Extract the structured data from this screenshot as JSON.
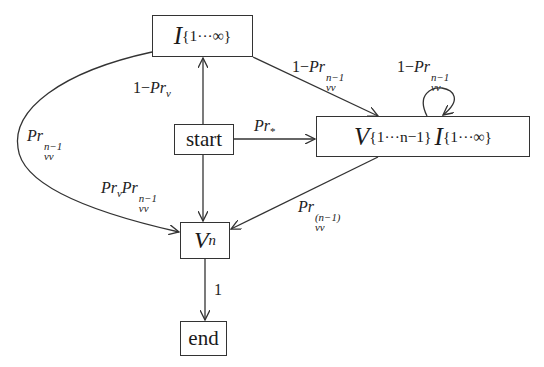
{
  "diagram": {
    "type": "state-transition-graph",
    "nodes": {
      "I": {
        "base": "I",
        "sup": "{1···∞}"
      },
      "start": {
        "label": "start"
      },
      "V": {
        "base1": "V",
        "sup1": "{1···n−1}",
        "base2": "I",
        "sup2": "{1···∞}"
      },
      "Vn": {
        "base": "V",
        "sup": "n"
      },
      "end": {
        "label": "end"
      }
    },
    "edges": [
      {
        "from": "start",
        "to": "I",
        "label": {
          "pre": "1−",
          "base": "Pr",
          "sub": "v"
        }
      },
      {
        "from": "I",
        "to": "V",
        "label": {
          "pre": "1−",
          "base": "Pr",
          "sup": "n−1",
          "sub": "vv"
        }
      },
      {
        "from": "V",
        "to": "V",
        "label": {
          "pre": "1−",
          "base": "Pr",
          "sup": "n−1",
          "sub": "vv"
        }
      },
      {
        "from": "start",
        "to": "V",
        "label": {
          "base": "Pr",
          "sub": "*"
        }
      },
      {
        "from": "I",
        "to": "Vn",
        "label": {
          "base": "Pr",
          "sup": "n−1",
          "sub": "vv"
        }
      },
      {
        "from": "start",
        "to": "Vn",
        "label": {
          "base1": "Pr",
          "sub1": "v",
          "base2": "Pr",
          "sup2": "n−1",
          "sub2": "vv"
        }
      },
      {
        "from": "V",
        "to": "Vn",
        "label": {
          "base": "Pr",
          "sup": "(n−1)",
          "sub": "vv"
        }
      },
      {
        "from": "Vn",
        "to": "end",
        "label": {
          "text": "1"
        }
      }
    ]
  }
}
